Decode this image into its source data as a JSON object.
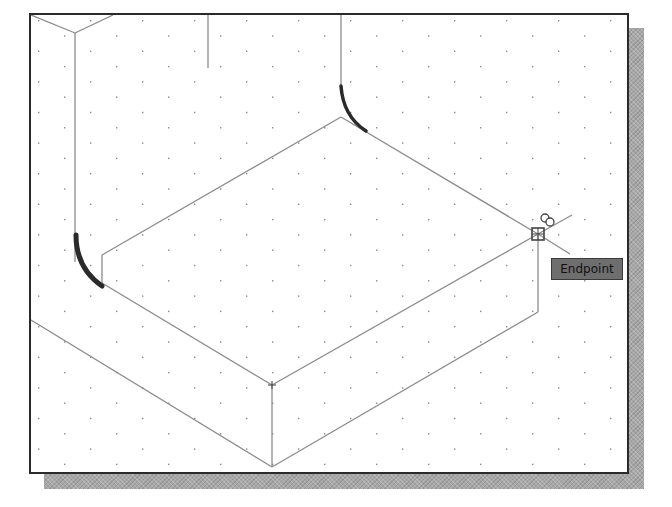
{
  "app": {
    "view": "isometric-drawing-viewport"
  },
  "viewport": {
    "background": "#ffffff",
    "border_color": "#2a2a2a",
    "grid": {
      "style": "isometric-dots",
      "dx": 52,
      "dy": 15.3,
      "dot_color": "#8a8a8a"
    },
    "line_color": "#8c8c8c",
    "highlight_color": "#2a2a2a"
  },
  "snap": {
    "marker": "endpoint-snap-marker",
    "x": 538,
    "y": 234,
    "tooltip_label": "Endpoint"
  },
  "drawing": {
    "lines": [
      {
        "id": "top-left-v-left",
        "x1": 31,
        "y1": 15,
        "x2": 75,
        "y2": 33
      },
      {
        "id": "top-left-v-right",
        "x1": 75,
        "y1": 33,
        "x2": 113,
        "y2": 15
      },
      {
        "id": "left-vertical",
        "x1": 75,
        "y1": 33,
        "x2": 75,
        "y2": 262
      },
      {
        "id": "top-mid-stub",
        "x1": 208,
        "y1": 15,
        "x2": 208,
        "y2": 68
      },
      {
        "id": "top-right-vertical",
        "x1": 341,
        "y1": 15,
        "x2": 341,
        "y2": 86
      },
      {
        "id": "top-face-back-left",
        "x1": 102,
        "y1": 255,
        "x2": 341,
        "y2": 117
      },
      {
        "id": "top-face-back-right",
        "x1": 341,
        "y1": 117,
        "x2": 538,
        "y2": 234
      },
      {
        "id": "top-face-front-left",
        "x1": 102,
        "y1": 283,
        "x2": 272,
        "y2": 385
      },
      {
        "id": "top-face-front-right",
        "x1": 272,
        "y1": 385,
        "x2": 538,
        "y2": 234
      },
      {
        "id": "inner-short-vertical",
        "x1": 102,
        "y1": 255,
        "x2": 102,
        "y2": 283
      },
      {
        "id": "front-edge-vertical",
        "x1": 272,
        "y1": 385,
        "x2": 272,
        "y2": 467
      },
      {
        "id": "right-edge-vertical",
        "x1": 538,
        "y1": 234,
        "x2": 538,
        "y2": 312
      },
      {
        "id": "right-bottom-edge",
        "x1": 538,
        "y1": 312,
        "x2": 272,
        "y2": 467
      },
      {
        "id": "base-left-edge",
        "x1": 31,
        "y1": 320,
        "x2": 272,
        "y2": 467
      },
      {
        "id": "snap-extension-right",
        "x1": 538,
        "y1": 234,
        "x2": 572,
        "y2": 215
      },
      {
        "id": "snap-extension-down",
        "x1": 538,
        "y1": 234,
        "x2": 570,
        "y2": 254
      }
    ],
    "arcs": [
      {
        "id": "fillet-back",
        "d": "M341,86 Q343,116 366,131"
      },
      {
        "id": "fillet-left",
        "d": "M76,235 Q76,268 102,286"
      }
    ],
    "crosshair_marks": [
      {
        "x": 272,
        "y": 385
      }
    ]
  }
}
